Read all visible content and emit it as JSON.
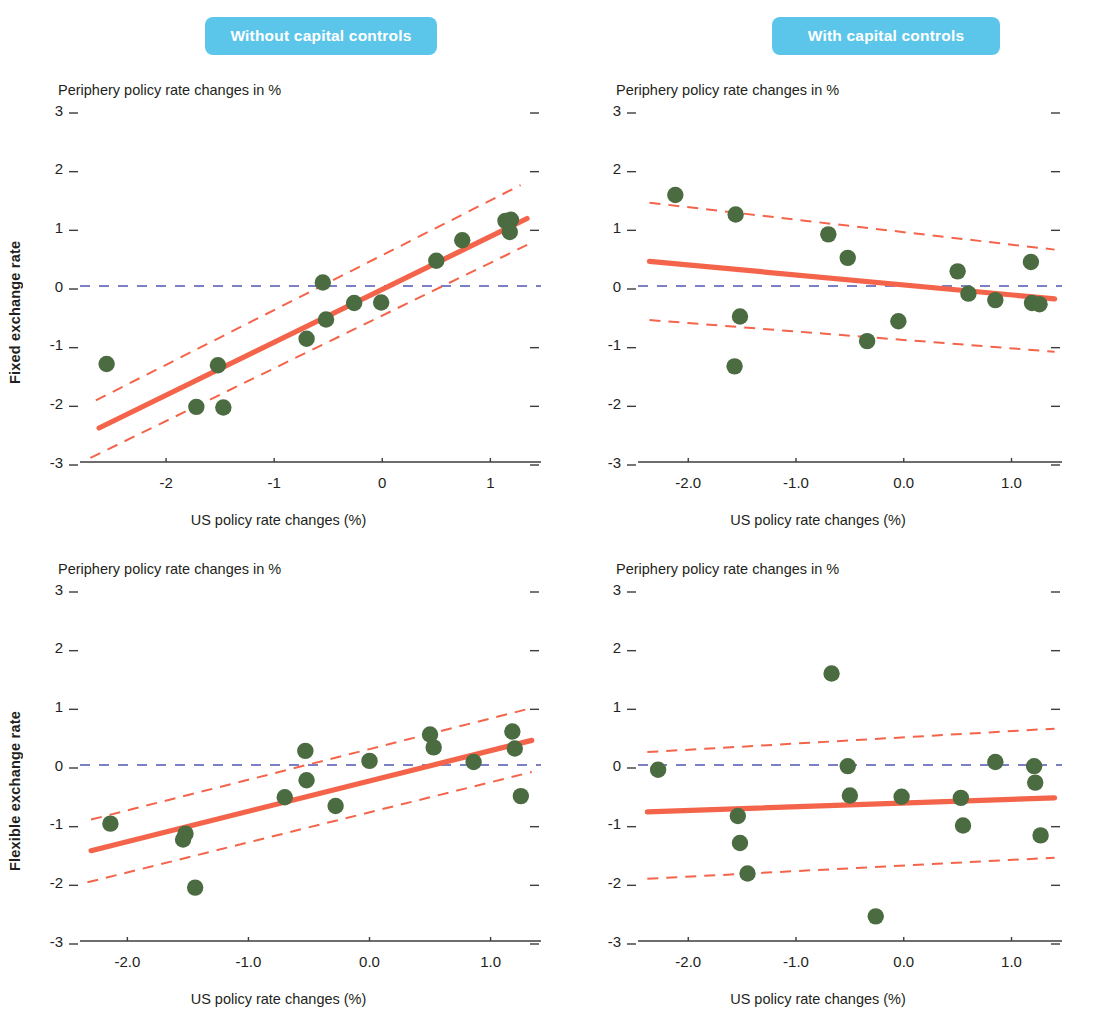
{
  "header": {
    "badges": [
      {
        "label": "Without capital controls",
        "color": "#5bc6ea"
      },
      {
        "label": "With capital controls",
        "color": "#5bc6ea"
      }
    ]
  },
  "row_labels": {
    "top": "Fixed exchange rate",
    "bottom": "Flexible exchange rate"
  },
  "axis_titles": {
    "y": "Periphery policy rate changes in %",
    "x": "US policy rate changes (%)"
  },
  "colors": {
    "dot": "#4b6b40",
    "fit_line": "#f4644a",
    "ci_line": "#f4644a",
    "zero_line": "#7b80c4",
    "axis": "#3c3c3c",
    "text": "#231f20",
    "badge": "#5bc6ea"
  },
  "chart_data": [
    {
      "id": "fixed-without-capital-controls",
      "type": "scatter",
      "title": "Without capital controls",
      "panel_row": "Fixed exchange rate",
      "xlabel": "US policy rate changes (%)",
      "ylabel": "Periphery policy rate changes in %",
      "xlim": [
        -2.75,
        1.45
      ],
      "ylim": [
        -3,
        3
      ],
      "xticks": [
        -2,
        -1,
        0,
        1
      ],
      "xticklabels": [
        "-2",
        "-1",
        "0",
        "1"
      ],
      "yticks": [
        -3,
        -2,
        -1,
        0,
        1,
        2,
        3
      ],
      "yticklabels": [
        "-3",
        "-2",
        "-1",
        "0",
        "1",
        "2",
        "3"
      ],
      "grid": false,
      "legend": "none",
      "points": [
        {
          "x": -2.55,
          "y": -1.33
        },
        {
          "x": -1.72,
          "y": -2.06
        },
        {
          "x": -1.52,
          "y": -1.35
        },
        {
          "x": -1.47,
          "y": -2.07
        },
        {
          "x": -0.7,
          "y": -0.9
        },
        {
          "x": -0.55,
          "y": 0.06
        },
        {
          "x": -0.52,
          "y": -0.57
        },
        {
          "x": -0.26,
          "y": -0.29
        },
        {
          "x": -0.01,
          "y": -0.28
        },
        {
          "x": 0.5,
          "y": 0.43
        },
        {
          "x": 0.74,
          "y": 0.78
        },
        {
          "x": 1.14,
          "y": 1.11
        },
        {
          "x": 1.19,
          "y": 1.13
        },
        {
          "x": 1.18,
          "y": 0.92
        }
      ],
      "fit_line": {
        "x0": -2.62,
        "y0": -2.42,
        "x1": 1.34,
        "y1": 1.15
      },
      "ci_upper": {
        "x0": -2.65,
        "y0": -1.95,
        "x1": 1.28,
        "y1": 1.72
      },
      "ci_lower": {
        "x0": -2.7,
        "y0": -2.93,
        "x1": 1.34,
        "y1": 0.7
      },
      "zero_line_y": 0
    },
    {
      "id": "fixed-with-capital-controls",
      "type": "scatter",
      "title": "With capital controls",
      "panel_row": "Fixed exchange rate",
      "xlabel": "US policy rate changes (%)",
      "ylabel": "Periphery policy rate changes in %",
      "xlim": [
        -2.42,
        1.45
      ],
      "ylim": [
        -3,
        3
      ],
      "xticks": [
        -2.0,
        -1.0,
        0.0,
        1.0
      ],
      "xticklabels": [
        "-2.0",
        "-1.0",
        "0.0",
        "1.0"
      ],
      "yticks": [
        -3,
        -2,
        -1,
        0,
        1,
        2,
        3
      ],
      "yticklabels": [
        "-3",
        "-2",
        "-1",
        "0",
        "1",
        "2",
        "3"
      ],
      "grid": false,
      "legend": "none",
      "points": [
        {
          "x": -2.12,
          "y": 1.55
        },
        {
          "x": -1.56,
          "y": 1.22
        },
        {
          "x": -1.52,
          "y": -0.52
        },
        {
          "x": -1.57,
          "y": -1.37
        },
        {
          "x": -0.7,
          "y": 0.88
        },
        {
          "x": -0.52,
          "y": 0.48
        },
        {
          "x": -0.34,
          "y": -0.94
        },
        {
          "x": -0.05,
          "y": -0.6
        },
        {
          "x": 0.5,
          "y": 0.25
        },
        {
          "x": 0.6,
          "y": -0.13
        },
        {
          "x": 0.85,
          "y": -0.24
        },
        {
          "x": 1.18,
          "y": 0.41
        },
        {
          "x": 1.19,
          "y": -0.29
        },
        {
          "x": 1.26,
          "y": -0.31
        }
      ],
      "fit_line": {
        "x0": -2.36,
        "y0": 0.42,
        "x1": 1.4,
        "y1": -0.22
      },
      "ci_upper": {
        "x0": -2.36,
        "y0": 1.42,
        "x1": 1.4,
        "y1": 0.62
      },
      "ci_lower": {
        "x0": -2.36,
        "y0": -0.58,
        "x1": 1.4,
        "y1": -1.12
      },
      "zero_line_y": 0
    },
    {
      "id": "flexible-without-capital-controls",
      "type": "scatter",
      "title": "Without capital controls",
      "panel_row": "Flexible exchange rate",
      "xlabel": "US policy rate changes (%)",
      "ylabel": "Periphery policy rate changes in %",
      "xlim": [
        -2.35,
        1.4
      ],
      "ylim": [
        -3,
        3
      ],
      "xticks": [
        -2.0,
        -1.0,
        0.0,
        1.0
      ],
      "xticklabels": [
        "-2.0",
        "-1.0",
        "0.0",
        "1.0"
      ],
      "yticks": [
        -3,
        -2,
        -1,
        0,
        1,
        2,
        3
      ],
      "yticklabels": [
        "-3",
        "-2",
        "-1",
        "0",
        "1",
        "2",
        "3"
      ],
      "grid": false,
      "legend": "none",
      "points": [
        {
          "x": -2.14,
          "y": -1.0
        },
        {
          "x": -1.52,
          "y": -1.17
        },
        {
          "x": -1.54,
          "y": -1.27
        },
        {
          "x": -1.44,
          "y": -2.09
        },
        {
          "x": -0.7,
          "y": -0.55
        },
        {
          "x": -0.53,
          "y": 0.24
        },
        {
          "x": -0.52,
          "y": -0.26
        },
        {
          "x": -0.28,
          "y": -0.7
        },
        {
          "x": 0.0,
          "y": 0.07
        },
        {
          "x": 0.5,
          "y": 0.52
        },
        {
          "x": 0.53,
          "y": 0.3
        },
        {
          "x": 0.86,
          "y": 0.05
        },
        {
          "x": 1.18,
          "y": 0.57
        },
        {
          "x": 1.2,
          "y": 0.28
        },
        {
          "x": 1.25,
          "y": -0.53
        }
      ],
      "fit_line": {
        "x0": -2.3,
        "y0": -1.46,
        "x1": 1.34,
        "y1": 0.42
      },
      "ci_upper": {
        "x0": -2.3,
        "y0": -0.93,
        "x1": 1.3,
        "y1": 0.95
      },
      "ci_lower": {
        "x0": -2.33,
        "y0": -2.0,
        "x1": 1.34,
        "y1": -0.12
      },
      "zero_line_y": 0
    },
    {
      "id": "flexible-with-capital-controls",
      "type": "scatter",
      "title": "With capital controls",
      "panel_row": "Flexible exchange rate",
      "xlabel": "US policy rate changes (%)",
      "ylabel": "Periphery policy rate changes in %",
      "xlim": [
        -2.42,
        1.45
      ],
      "ylim": [
        -3,
        3
      ],
      "xticks": [
        -2.0,
        -1.0,
        0.0,
        1.0
      ],
      "xticklabels": [
        "-2.0",
        "-1.0",
        "0.0",
        "1.0"
      ],
      "yticks": [
        -3,
        -2,
        -1,
        0,
        1,
        2,
        3
      ],
      "yticklabels": [
        "-3",
        "-2",
        "-1",
        "0",
        "1",
        "2",
        "3"
      ],
      "grid": false,
      "legend": "none",
      "points": [
        {
          "x": -2.28,
          "y": -0.08
        },
        {
          "x": -1.54,
          "y": -0.87
        },
        {
          "x": -1.52,
          "y": -1.33
        },
        {
          "x": -1.45,
          "y": -1.85
        },
        {
          "x": -0.67,
          "y": 1.56
        },
        {
          "x": -0.52,
          "y": -0.02
        },
        {
          "x": -0.5,
          "y": -0.52
        },
        {
          "x": -0.26,
          "y": -2.58
        },
        {
          "x": -0.02,
          "y": -0.54
        },
        {
          "x": 0.53,
          "y": -0.56
        },
        {
          "x": 0.55,
          "y": -1.03
        },
        {
          "x": 0.85,
          "y": 0.05
        },
        {
          "x": 1.21,
          "y": -0.02
        },
        {
          "x": 1.22,
          "y": -0.3
        },
        {
          "x": 1.27,
          "y": -1.2
        }
      ],
      "fit_line": {
        "x0": -2.38,
        "y0": -0.8,
        "x1": 1.4,
        "y1": -0.56
      },
      "ci_upper": {
        "x0": -2.38,
        "y0": 0.22,
        "x1": 1.4,
        "y1": 0.62
      },
      "ci_lower": {
        "x0": -2.38,
        "y0": -1.94,
        "x1": 1.4,
        "y1": -1.58
      },
      "zero_line_y": 0
    }
  ]
}
